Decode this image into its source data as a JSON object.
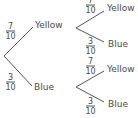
{
  "diagram": {
    "type": "probability-tree",
    "first_stage": {
      "branches": [
        {
          "outcome": "Yellow",
          "numerator": "7",
          "denominator": "10"
        },
        {
          "outcome": "Blue",
          "numerator": "3",
          "denominator": "10"
        }
      ]
    },
    "second_stage": [
      {
        "parent": "Yellow",
        "branches": [
          {
            "outcome": "Yellow",
            "numerator": "7",
            "denominator": "10"
          },
          {
            "outcome": "Blue",
            "numerator": "3",
            "denominator": "10"
          }
        ]
      },
      {
        "parent": "Blue",
        "branches": [
          {
            "outcome": "Yellow",
            "numerator": "7",
            "denominator": "10"
          },
          {
            "outcome": "Blue",
            "numerator": "3",
            "denominator": "10"
          }
        ]
      }
    ],
    "colors": {
      "line": "#555555",
      "text": "#4a4a4a"
    }
  }
}
